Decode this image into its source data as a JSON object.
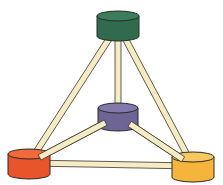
{
  "diagram": {
    "type": "tetrahedral-ball-and-stick",
    "colors": {
      "rod_fill": "#f5ebc4",
      "rod_stroke": "#3a3528",
      "outline": "#2a2a2a"
    },
    "nodes": [
      {
        "id": "top",
        "label": "green node",
        "cx": 118,
        "cy": 16,
        "rx": 21,
        "ry": 5,
        "h": 20,
        "fill": "#2f6b4c",
        "top_fill": "#3b7d5b"
      },
      {
        "id": "center",
        "label": "purple node",
        "cx": 118,
        "cy": 108,
        "rx": 20,
        "ry": 5,
        "h": 18,
        "fill": "#6f6496",
        "top_fill": "#8378aa"
      },
      {
        "id": "left",
        "label": "red node",
        "cx": 29,
        "cy": 154,
        "rx": 21,
        "ry": 5,
        "h": 20,
        "fill": "#e9552a",
        "top_fill": "#f06a3c"
      },
      {
        "id": "right",
        "label": "yellow node",
        "cx": 193,
        "cy": 157,
        "rx": 21,
        "ry": 5,
        "h": 20,
        "fill": "#f5b43c",
        "top_fill": "#f8c75e"
      }
    ],
    "edges": [
      {
        "from": "top",
        "to": "left"
      },
      {
        "from": "top",
        "to": "right"
      },
      {
        "from": "top",
        "to": "center"
      },
      {
        "from": "center",
        "to": "left"
      },
      {
        "from": "center",
        "to": "right"
      },
      {
        "from": "left",
        "to": "right"
      }
    ]
  }
}
